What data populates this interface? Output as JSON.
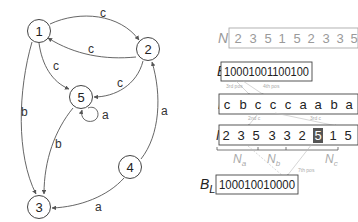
{
  "graph": {
    "nodes": [
      {
        "id": "1",
        "label": "1",
        "x": 39,
        "y": 31
      },
      {
        "id": "2",
        "label": "2",
        "x": 148,
        "y": 49
      },
      {
        "id": "3",
        "label": "3",
        "x": 39,
        "y": 207
      },
      {
        "id": "4",
        "label": "4",
        "x": 130,
        "y": 167
      },
      {
        "id": "5",
        "label": "5",
        "x": 81,
        "y": 97
      }
    ],
    "edges": [
      {
        "from": "1",
        "to": "2",
        "label": "c"
      },
      {
        "from": "2",
        "to": "1",
        "label": "c"
      },
      {
        "from": "1",
        "to": "5",
        "label": "c"
      },
      {
        "from": "2",
        "to": "5",
        "label": "c"
      },
      {
        "from": "5",
        "to": "5",
        "label": "a"
      },
      {
        "from": "1",
        "to": "3",
        "label": "b"
      },
      {
        "from": "5",
        "to": "3",
        "label": "b"
      },
      {
        "from": "4",
        "to": "2",
        "label": "a"
      },
      {
        "from": "4",
        "to": "3",
        "label": "a"
      }
    ],
    "edge_labels": {
      "e12": "c",
      "e21": "c",
      "e15": "c",
      "e25": "c",
      "e55": "a",
      "e13": "b",
      "e53": "b",
      "e42": "a",
      "e43": "a"
    }
  },
  "structures": {
    "n_original": {
      "label": "N",
      "values": [
        "2",
        "3",
        "5",
        "1",
        "5",
        "2",
        "3",
        "3",
        "5"
      ]
    },
    "b": {
      "label": "B",
      "bits": "10001001100100"
    },
    "l": {
      "label": "L",
      "values": [
        "c",
        "b",
        "c",
        "c",
        "c",
        "a",
        "a",
        "b",
        "a"
      ]
    },
    "n": {
      "label": "N",
      "values": [
        "2",
        "3",
        "5",
        "3",
        "3",
        "2",
        "5",
        "1",
        "5"
      ],
      "highlighted_index": 6
    },
    "segments": [
      {
        "base": "N",
        "sub": "a"
      },
      {
        "base": "N",
        "sub": "b"
      },
      {
        "base": "N",
        "sub": "c"
      }
    ],
    "bl": {
      "label": "B",
      "sub": "L",
      "bits": "100010010000"
    },
    "annotations": {
      "pos3": "3rd pos",
      "pos4": "4th pos",
      "c2": "2nd c",
      "c3": "3rd c",
      "pos7": "7th pos"
    }
  },
  "colors": {
    "highlight_cell": "#555555",
    "faded": "#aaaaaa"
  }
}
